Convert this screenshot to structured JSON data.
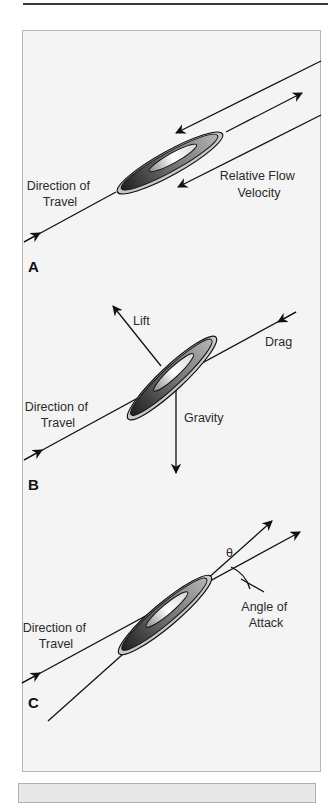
{
  "figure": {
    "panels": [
      {
        "letter": "A",
        "labels": {
          "direction": [
            "Direction of",
            "Travel"
          ],
          "flow": [
            "Relative Flow",
            "Velocity"
          ]
        }
      },
      {
        "letter": "B",
        "labels": {
          "lift": "Lift",
          "drag": "Drag",
          "gravity": "Gravity",
          "direction": [
            "Direction of",
            "Travel"
          ]
        }
      },
      {
        "letter": "C",
        "labels": {
          "theta": "θ",
          "angle": [
            "Angle of",
            "Attack"
          ],
          "direction": [
            "Direction of",
            "Travel"
          ]
        }
      }
    ],
    "colors": {
      "panel_bg": "#f4f4f4",
      "line": "#111111",
      "disc_dark": "#2e2e2e",
      "disc_mid": "#8a8a8a",
      "disc_light": "#f0f0f0",
      "rim": "#c8c8c8"
    }
  }
}
